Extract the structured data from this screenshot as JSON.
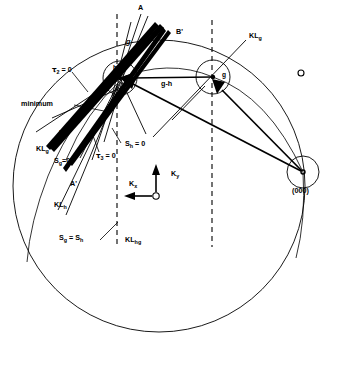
{
  "figure": {
    "name": "ewald-kikuchi-construction",
    "background": "#ffffff",
    "stroke": "#000000",
    "width": 339,
    "height": 385
  },
  "nodes": {
    "h": {
      "label": "h",
      "cx": 120,
      "cy": 78,
      "r": 17
    },
    "g": {
      "label": "g",
      "cx": 213,
      "cy": 77,
      "r": 17
    },
    "origin": {
      "label": "(000)",
      "cx": 303,
      "cy": 172,
      "r": 16
    },
    "spot": {
      "label": "o",
      "cx": 301,
      "cy": 73,
      "r": 3
    }
  },
  "big_circle": {
    "cx": 159,
    "cy": 186,
    "r": 146
  },
  "dashed_lines": [
    {
      "name": "dashed-line-h",
      "x": 117,
      "y1": 14,
      "y2": 247
    },
    {
      "name": "dashed-line-g",
      "x": 212,
      "y1": 20,
      "y2": 247
    }
  ],
  "labels": {
    "A": "A",
    "A_prime": "A'",
    "B": "B",
    "B_prime": "B'",
    "g_node": "g",
    "g_upper": "g",
    "h_node": "h",
    "g_minus_h": "g-h",
    "tau2": "τ",
    "tau2_sub": "2",
    "tau2_eq": " = 0",
    "tau3": "τ",
    "tau3_sub": "3",
    "tau3_eq": " = 0",
    "minimum": "minimum",
    "Sh_zero_main": "S",
    "Sh_zero_sub": "h",
    "Sh_zero_eq": " = 0",
    "Sg_zero_main": "S",
    "Sg_zero_sub": "g",
    "Sg_zero_eq": "=0",
    "Sg_eq_Sh": "S",
    "Sg_eq_Sh_sub1": "g",
    "Sg_eq_Sh_mid": " = S",
    "Sg_eq_Sh_sub2": "h",
    "KLg_right": "KL",
    "KLg_right_sub": "g",
    "KLg_left": "KL",
    "KLg_left_sub": "g",
    "KLh": "KL",
    "KLh_sub": "h",
    "KLhg": "KL",
    "KLhg_sub": "hg",
    "Kx": "K",
    "Kx_sub": "x",
    "Ky": "K",
    "Ky_sub": "y",
    "origin_000": "(000)"
  }
}
